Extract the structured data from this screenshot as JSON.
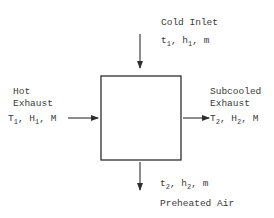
{
  "diagram": {
    "center_block": "heat-exchanger",
    "cold_inlet": {
      "title": "Cold Inlet",
      "vars": [
        {
          "sym": "t",
          "sub": "1"
        },
        {
          "sym": "h",
          "sub": "1"
        },
        {
          "sym": "m",
          "sub": ""
        }
      ]
    },
    "hot_exhaust": {
      "title_line1": "Hot",
      "title_line2": "Exhaust",
      "vars": [
        {
          "sym": "T",
          "sub": "1"
        },
        {
          "sym": "H",
          "sub": "1"
        },
        {
          "sym": "M",
          "sub": ""
        }
      ]
    },
    "subcooled_exhaust": {
      "title_line1": "Subcooled",
      "title_line2": "Exhaust",
      "vars": [
        {
          "sym": "T",
          "sub": "2"
        },
        {
          "sym": "H",
          "sub": "2"
        },
        {
          "sym": "M",
          "sub": ""
        }
      ]
    },
    "preheated_air": {
      "title": "Preheated Air",
      "vars": [
        {
          "sym": "t",
          "sub": "2"
        },
        {
          "sym": "h",
          "sub": "2"
        },
        {
          "sym": "m",
          "sub": ""
        }
      ]
    },
    "separator": ", ",
    "ink_color": "#2e2e2e"
  }
}
